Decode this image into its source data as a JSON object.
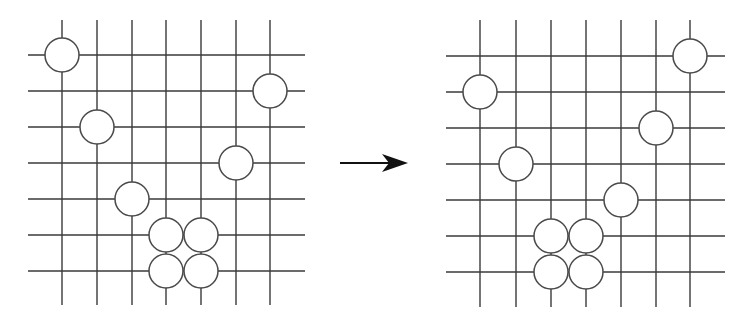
{
  "diagram": {
    "type": "go-board-transformation",
    "arrow": {
      "direction": "right",
      "x1": 340,
      "x2": 408,
      "y": 163
    },
    "boards": [
      {
        "id": "before",
        "cols_x": [
          62,
          97,
          132,
          166,
          201,
          236,
          270
        ],
        "rows_y": [
          55,
          91,
          127,
          163,
          199,
          235,
          271
        ],
        "line_extent": {
          "x_min": 28,
          "x_max": 305,
          "y_min": 20,
          "y_max": 305
        },
        "stone_radius": 17,
        "stones": [
          {
            "col": 0,
            "row": 0
          },
          {
            "col": 6,
            "row": 1
          },
          {
            "col": 1,
            "row": 2
          },
          {
            "col": 5,
            "row": 3
          },
          {
            "col": 2,
            "row": 4
          },
          {
            "col": 3,
            "row": 5
          },
          {
            "col": 4,
            "row": 5
          },
          {
            "col": 3,
            "row": 6
          },
          {
            "col": 4,
            "row": 6
          }
        ]
      },
      {
        "id": "after",
        "cols_x": [
          480,
          516,
          551,
          586,
          621,
          656,
          690
        ],
        "rows_y": [
          56,
          92,
          128,
          164,
          200,
          236,
          272
        ],
        "line_extent": {
          "x_min": 446,
          "x_max": 725,
          "y_min": 20,
          "y_max": 307
        },
        "stone_radius": 17,
        "stones": [
          {
            "col": 6,
            "row": 0
          },
          {
            "col": 0,
            "row": 1
          },
          {
            "col": 5,
            "row": 2
          },
          {
            "col": 1,
            "row": 3
          },
          {
            "col": 4,
            "row": 4
          },
          {
            "col": 2,
            "row": 5
          },
          {
            "col": 3,
            "row": 5
          },
          {
            "col": 2,
            "row": 6
          },
          {
            "col": 3,
            "row": 6
          }
        ]
      }
    ]
  }
}
